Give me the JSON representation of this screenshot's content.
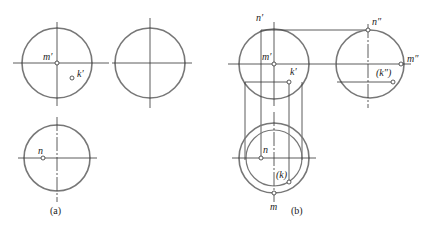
{
  "figure": {
    "panels": [
      {
        "id": "a",
        "caption": "(a)"
      },
      {
        "id": "b",
        "caption": "(b)"
      }
    ],
    "labels": {
      "a_m_prime": "m′",
      "a_k_prime": "k′",
      "a_n": "n",
      "b_n_prime": "n′",
      "b_m_prime": "m′",
      "b_k_prime": "k′",
      "b_n_dprime": "n″",
      "b_m_dprime": "m″",
      "b_k_dprime": "(k″)",
      "b_n": "n",
      "b_k": "(k)",
      "b_m": "m"
    },
    "colors": {
      "circle": "#777777",
      "line": "#333333"
    }
  }
}
